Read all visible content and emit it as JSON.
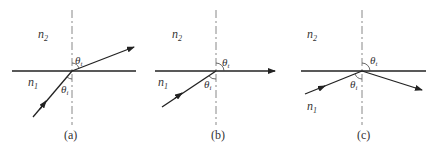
{
  "figure": {
    "panels": [
      {
        "id": "a",
        "caption": "(a)",
        "medium_top": "n",
        "medium_top_sub": "2",
        "medium_bottom": "n",
        "medium_bottom_sub": "1",
        "angle_incident": "θ",
        "angle_incident_sub": "i",
        "angle_transmitted": "θ",
        "angle_transmitted_sub": "t",
        "case": "refraction"
      },
      {
        "id": "b",
        "caption": "(b)",
        "medium_top": "n",
        "medium_top_sub": "2",
        "medium_bottom": "n",
        "medium_bottom_sub": "1",
        "angle_incident": "θ",
        "angle_incident_sub": "i",
        "angle_transmitted": "θ",
        "angle_transmitted_sub": "t",
        "case": "critical angle (grazing transmission)"
      },
      {
        "id": "c",
        "caption": "(c)",
        "medium_top": "n",
        "medium_top_sub": "2",
        "medium_bottom": "n",
        "medium_bottom_sub": "1",
        "angle_incident": "θ",
        "angle_incident_sub": "i",
        "angle_transmitted": "θ",
        "angle_transmitted_sub": "t",
        "case": "total internal reflection"
      }
    ],
    "colors": {
      "line": "#222222",
      "normal": "#888888",
      "text": "#333333"
    }
  }
}
